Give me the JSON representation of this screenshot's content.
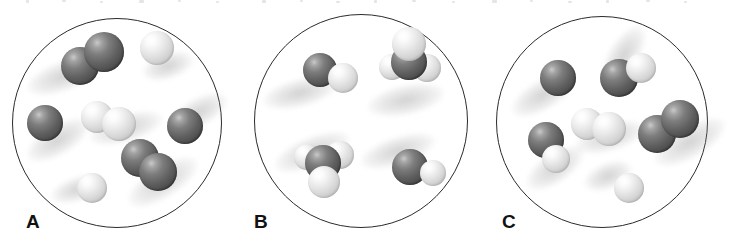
{
  "figure": {
    "background_color": "#ffffff",
    "outline_color": "#2b2b2b",
    "dark_atom_color": "#5f5f5f",
    "light_atom_color": "#d6d6d6",
    "width": 721,
    "height": 246
  },
  "panels": [
    {
      "label": "A",
      "label_x": 26,
      "label_y": 212,
      "flask": {
        "x": 12,
        "y": 18,
        "d": 210
      },
      "species_summary": "2 dark diatomic molecules, 1 light diatomic molecule, 2 single dark atoms, 2 single light atoms",
      "molecules": [
        {
          "name": "dark-diatomic-upper-left",
          "shadow": {
            "x": 64,
            "y": 76,
            "w": 78,
            "h": 30,
            "rot": -20
          },
          "atoms": [
            {
              "type": "dark",
              "x": 80,
              "y": 66,
              "r": 19
            },
            {
              "type": "dark",
              "x": 104,
              "y": 52,
              "r": 20
            }
          ]
        },
        {
          "name": "light-single-upper-right",
          "shadow": {
            "x": 168,
            "y": 66,
            "w": 52,
            "h": 26,
            "rot": -18
          },
          "atoms": [
            {
              "type": "light",
              "x": 157,
              "y": 48,
              "r": 17
            }
          ]
        },
        {
          "name": "dark-single-left",
          "shadow": {
            "x": 58,
            "y": 140,
            "w": 70,
            "h": 30,
            "rot": -30
          },
          "atoms": [
            {
              "type": "dark",
              "x": 45,
              "y": 123,
              "r": 18
            }
          ]
        },
        {
          "name": "light-diatomic-center",
          "shadow": {
            "x": 126,
            "y": 128,
            "w": 76,
            "h": 28,
            "rot": -16
          },
          "atoms": [
            {
              "type": "light",
              "x": 97,
              "y": 117,
              "r": 16
            },
            {
              "type": "light",
              "x": 119,
              "y": 124,
              "r": 17
            }
          ]
        },
        {
          "name": "dark-single-right",
          "shadow": {
            "x": 199,
            "y": 112,
            "w": 62,
            "h": 28,
            "rot": -28
          },
          "atoms": [
            {
              "type": "dark",
              "x": 185,
              "y": 126,
              "r": 18
            }
          ]
        },
        {
          "name": "dark-diatomic-lower-center",
          "shadow": {
            "x": 163,
            "y": 182,
            "w": 80,
            "h": 32,
            "rot": -32
          },
          "atoms": [
            {
              "type": "dark",
              "x": 140,
              "y": 158,
              "r": 19
            },
            {
              "type": "dark",
              "x": 158,
              "y": 172,
              "r": 19
            }
          ]
        },
        {
          "name": "light-single-bottom",
          "shadow": {
            "x": 78,
            "y": 189,
            "w": 56,
            "h": 24,
            "rot": -18
          },
          "atoms": [
            {
              "type": "light",
              "x": 92,
              "y": 188,
              "r": 15
            }
          ]
        }
      ]
    },
    {
      "label": "B",
      "label_x": 254,
      "label_y": 212,
      "flask": {
        "x": 254,
        "y": 14,
        "d": 214
      },
      "species_summary": "2 dark-light diatomic molecules, 2 tetrahedral molecules with dark center and three light atoms",
      "molecules": [
        {
          "name": "heteronuclear-diatomic-upper-left",
          "shadow": {
            "x": 300,
            "y": 93,
            "w": 76,
            "h": 28,
            "rot": -14
          },
          "atoms": [
            {
              "type": "dark",
              "x": 320,
              "y": 70,
              "r": 17
            },
            {
              "type": "light",
              "x": 343,
              "y": 78,
              "r": 15
            }
          ]
        },
        {
          "name": "polyatomic-upper-right",
          "shadow": {
            "x": 406,
            "y": 100,
            "w": 78,
            "h": 30,
            "rot": -12
          },
          "atoms": [
            {
              "type": "light",
              "x": 392,
              "y": 67,
              "r": 13
            },
            {
              "type": "light",
              "x": 427,
              "y": 68,
              "r": 14
            },
            {
              "type": "dark",
              "x": 409,
              "y": 62,
              "r": 18
            },
            {
              "type": "light",
              "x": 409,
              "y": 44,
              "r": 17
            }
          ]
        },
        {
          "name": "polyatomic-lower-left",
          "shadow": {
            "x": 312,
            "y": 152,
            "w": 80,
            "h": 30,
            "rot": -22
          },
          "atoms": [
            {
              "type": "light",
              "x": 307,
              "y": 157,
              "r": 13
            },
            {
              "type": "light",
              "x": 340,
              "y": 155,
              "r": 14
            },
            {
              "type": "dark",
              "x": 323,
              "y": 163,
              "r": 18
            },
            {
              "type": "light",
              "x": 324,
              "y": 182,
              "r": 16
            }
          ]
        },
        {
          "name": "heteronuclear-diatomic-lower-right",
          "shadow": {
            "x": 398,
            "y": 151,
            "w": 78,
            "h": 28,
            "rot": -18
          },
          "atoms": [
            {
              "type": "dark",
              "x": 410,
              "y": 167,
              "r": 18
            },
            {
              "type": "light",
              "x": 433,
              "y": 173,
              "r": 13
            }
          ]
        }
      ]
    },
    {
      "label": "C",
      "label_x": 502,
      "label_y": 212,
      "flask": {
        "x": 496,
        "y": 16,
        "d": 212
      },
      "species_summary": "1 dark-light diatomic, 1 dark diatomic, 1 light diatomic, 1 vertical dark-light pair, 1 single dark atom, 1 single light atom",
      "molecules": [
        {
          "name": "dark-single-upper-left",
          "shadow": {
            "x": 543,
            "y": 95,
            "w": 70,
            "h": 30,
            "rot": -30
          },
          "atoms": [
            {
              "type": "dark",
              "x": 558,
              "y": 78,
              "r": 18
            }
          ]
        },
        {
          "name": "heteronuclear-diatomic-upper-center",
          "shadow": {
            "x": 624,
            "y": 55,
            "w": 66,
            "h": 30,
            "rot": -58
          },
          "atoms": [
            {
              "type": "dark",
              "x": 619,
              "y": 78,
              "r": 19
            },
            {
              "type": "light",
              "x": 641,
              "y": 68,
              "r": 15
            }
          ]
        },
        {
          "name": "light-diatomic-center",
          "shadow": {
            "x": 610,
            "y": 137,
            "w": 72,
            "h": 28,
            "rot": -16
          },
          "atoms": [
            {
              "type": "light",
              "x": 587,
              "y": 124,
              "r": 16
            },
            {
              "type": "light",
              "x": 609,
              "y": 129,
              "r": 17
            }
          ]
        },
        {
          "name": "dark-diatomic-right",
          "shadow": {
            "x": 690,
            "y": 142,
            "w": 80,
            "h": 32,
            "rot": -30
          },
          "atoms": [
            {
              "type": "dark",
              "x": 657,
              "y": 134,
              "r": 19
            },
            {
              "type": "dark",
              "x": 680,
              "y": 119,
              "r": 19
            }
          ]
        },
        {
          "name": "vertical-dark-light-pair-left",
          "shadow": {
            "x": 555,
            "y": 168,
            "w": 66,
            "h": 30,
            "rot": -34
          },
          "atoms": [
            {
              "type": "dark",
              "x": 546,
              "y": 140,
              "r": 18
            },
            {
              "type": "light",
              "x": 556,
              "y": 159,
              "r": 14
            }
          ]
        },
        {
          "name": "light-single-bottom",
          "shadow": {
            "x": 608,
            "y": 176,
            "w": 50,
            "h": 26,
            "rot": -22
          },
          "atoms": [
            {
              "type": "light",
              "x": 629,
              "y": 188,
              "r": 15
            }
          ]
        }
      ]
    }
  ]
}
